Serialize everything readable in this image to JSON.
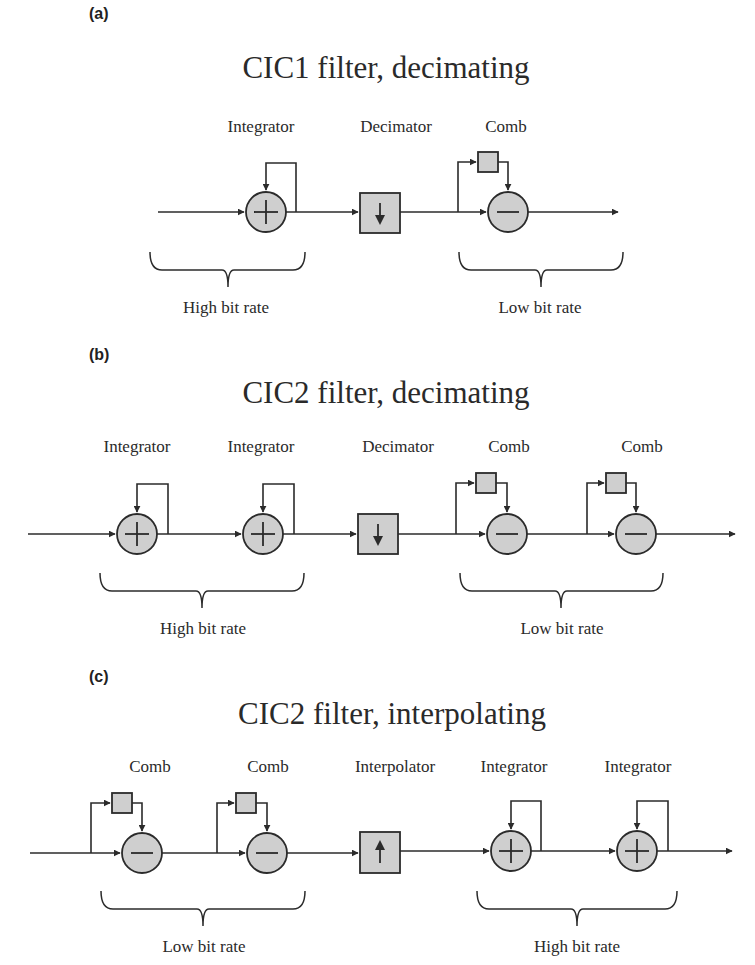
{
  "colors": {
    "background": "#ffffff",
    "line": "#2b2b2b",
    "block_fill": "#cfcfcf",
    "text": "#2a2a2a"
  },
  "panels": [
    {
      "id": "a",
      "panel_label": "(a)",
      "title": "CIC1 filter, decimating",
      "blocks": [
        {
          "type": "integrator",
          "label": "Integrator",
          "symbol": "plus-icon"
        },
        {
          "type": "decimator",
          "label": "Decimator",
          "symbol": "down-arrow-icon"
        },
        {
          "type": "comb",
          "label": "Comb",
          "symbol": "minus-icon"
        }
      ],
      "rate_labels": [
        "High bit rate",
        "Low bit rate"
      ]
    },
    {
      "id": "b",
      "panel_label": "(b)",
      "title": "CIC2 filter, decimating",
      "blocks": [
        {
          "type": "integrator",
          "label": "Integrator",
          "symbol": "plus-icon"
        },
        {
          "type": "integrator",
          "label": "Integrator",
          "symbol": "plus-icon"
        },
        {
          "type": "decimator",
          "label": "Decimator",
          "symbol": "down-arrow-icon"
        },
        {
          "type": "comb",
          "label": "Comb",
          "symbol": "minus-icon"
        },
        {
          "type": "comb",
          "label": "Comb",
          "symbol": "minus-icon"
        }
      ],
      "rate_labels": [
        "High bit rate",
        "Low bit rate"
      ]
    },
    {
      "id": "c",
      "panel_label": "(c)",
      "title": "CIC2 filter, interpolating",
      "blocks": [
        {
          "type": "comb",
          "label": "Comb",
          "symbol": "minus-icon"
        },
        {
          "type": "comb",
          "label": "Comb",
          "symbol": "minus-icon"
        },
        {
          "type": "interpolator",
          "label": "Interpolator",
          "symbol": "up-arrow-icon"
        },
        {
          "type": "integrator",
          "label": "Integrator",
          "symbol": "plus-icon"
        },
        {
          "type": "integrator",
          "label": "Integrator",
          "symbol": "plus-icon"
        }
      ],
      "rate_labels": [
        "Low bit rate",
        "High bit rate"
      ]
    }
  ]
}
